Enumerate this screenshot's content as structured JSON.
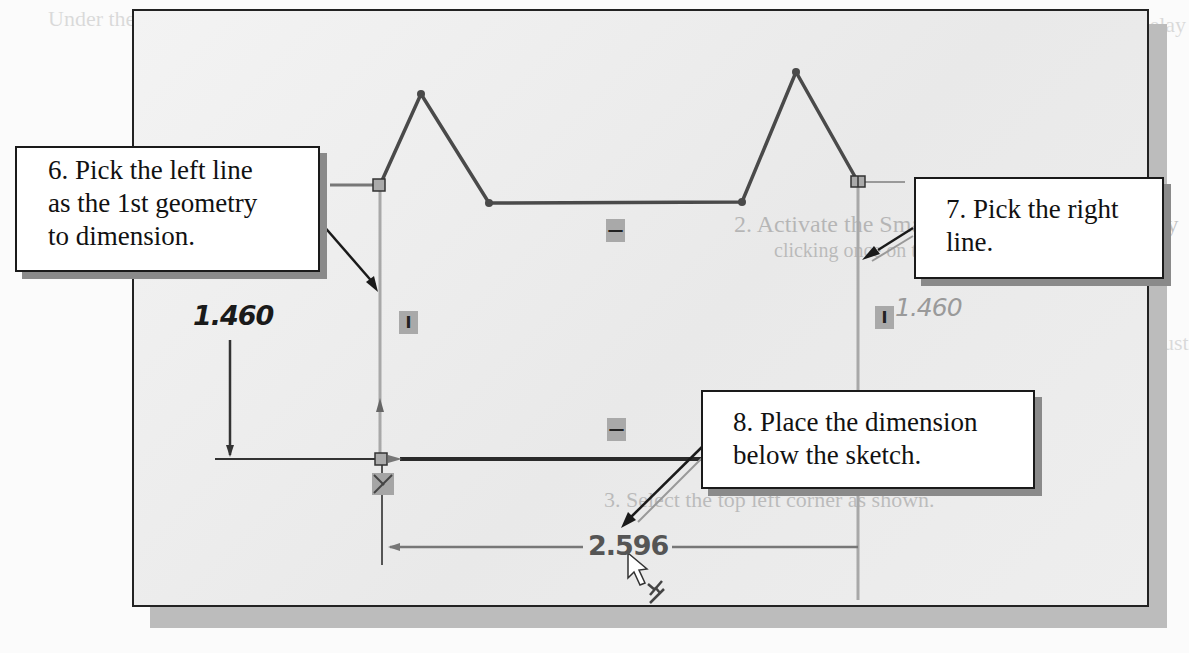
{
  "background_text": {
    "line1": "In parametric modeling, it may be necessary to delay",
    "line2": "the adjustment of some dimensions.",
    "step_activate": "2. Activate the Smart Dimension command by",
    "step_activate_sub": "clicking once on the icon.",
    "step_select": "3. Select the top left corner as shown.",
    "left_fragment": "Under the",
    "right_fragment": "Adjust"
  },
  "sketch": {
    "dimension_vertical_left": "1.460",
    "dimension_vertical_right": "1.460",
    "dimension_horizontal": "2.596",
    "relation_vertical_glyph": "I",
    "relation_horizontal_glyph": "—"
  },
  "callouts": {
    "step6": {
      "line1": "6. Pick the left line",
      "line2": "as the 1st geometry",
      "line3": "to dimension."
    },
    "step7": {
      "line1": "7. Pick the right",
      "line2": "line."
    },
    "step8": {
      "line1": "8. Place the dimension",
      "line2": "below the sketch."
    }
  },
  "colors": {
    "sketch_line": "#4a4a4a",
    "panel_bg": "#ececec",
    "callout_border": "#1a1a1a",
    "shadow": "#9a9a9a"
  }
}
